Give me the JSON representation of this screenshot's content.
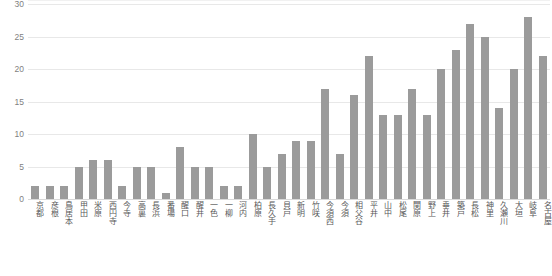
{
  "chart_data": {
    "type": "bar",
    "title": "",
    "subtitle": "",
    "xlabel": "",
    "ylabel": "",
    "ylim": [
      0,
      30
    ],
    "ytick_values": [
      0,
      5,
      10,
      15,
      20,
      25,
      30
    ],
    "ytick_labels": [
      "0",
      "5",
      "10",
      "15",
      "20",
      "25",
      "30"
    ],
    "grid": true,
    "legend": false,
    "bar_color": "#9b9b9b",
    "gridline_color": "#e8e8e8",
    "categories": [
      "京都",
      "彦根",
      "鳥居本",
      "甲田",
      "米原",
      "西円寺",
      "今寺",
      "高裏",
      "長浜",
      "番場",
      "醒口",
      "醒井",
      "一色",
      "一柳",
      "河内",
      "柏原",
      "長久手",
      "貝戸",
      "新明",
      "竹咲",
      "今須西",
      "今須",
      "相父谷",
      "平井",
      "山中",
      "松尾",
      "関原",
      "野上",
      "垂井",
      "築戸",
      "長松",
      "神里",
      "久瀬川",
      "大垣",
      "岐阜",
      "名古屋"
    ],
    "values": [
      2,
      2,
      2,
      5,
      6,
      6,
      2,
      5,
      5,
      1,
      8,
      5,
      5,
      2,
      2,
      10,
      5,
      7,
      9,
      9,
      17,
      7,
      16,
      22,
      13,
      13,
      17,
      13,
      20,
      23,
      27,
      25,
      14,
      20,
      28,
      22
    ],
    "series": [
      {
        "name": "count",
        "values": [
          2,
          2,
          2,
          5,
          6,
          6,
          2,
          5,
          5,
          1,
          8,
          5,
          5,
          2,
          2,
          10,
          5,
          7,
          9,
          9,
          17,
          7,
          16,
          22,
          13,
          13,
          17,
          13,
          20,
          23,
          27,
          25,
          14,
          20,
          28,
          22
        ]
      }
    ]
  }
}
